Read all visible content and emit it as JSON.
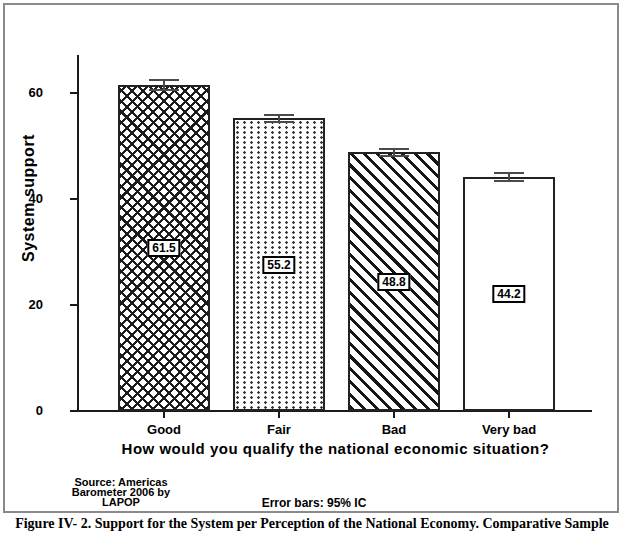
{
  "figure": {
    "caption": "Figure IV- 2. Support for the System per Perception of the National Economy. Comparative Sample",
    "source_note_lines": [
      "Source: Americas",
      "Barometer 2006 by",
      "LAPOP"
    ],
    "error_note": "Error bars: 95% IC"
  },
  "chart_data": {
    "type": "bar",
    "title": "",
    "xlabel": "How would you qualify the national economic situation?",
    "ylabel": "System support",
    "categories": [
      "Good",
      "Fair",
      "Bad",
      "Very bad"
    ],
    "values": [
      61.5,
      55.2,
      48.8,
      44.2
    ],
    "errors": [
      1.1,
      0.9,
      0.9,
      0.9
    ],
    "bar_patterns": [
      "crosshatch",
      "dots",
      "diagonal-stripes",
      "plain"
    ],
    "value_labels": [
      "61.5",
      "55.2",
      "48.8",
      "44.2"
    ],
    "yticks": [
      0,
      20,
      40,
      60
    ],
    "ylim": [
      0,
      67
    ],
    "grid": false,
    "legend": "none",
    "error_note": "Error bars: 95% IC",
    "colors": {
      "bar_fill": "#ffffff",
      "pattern_ink": "#1a1a1a",
      "bar_outline": "#222222",
      "error_bar": "#4a4a4a",
      "frame_border": "#8a8a8a",
      "text": "#000000"
    }
  }
}
